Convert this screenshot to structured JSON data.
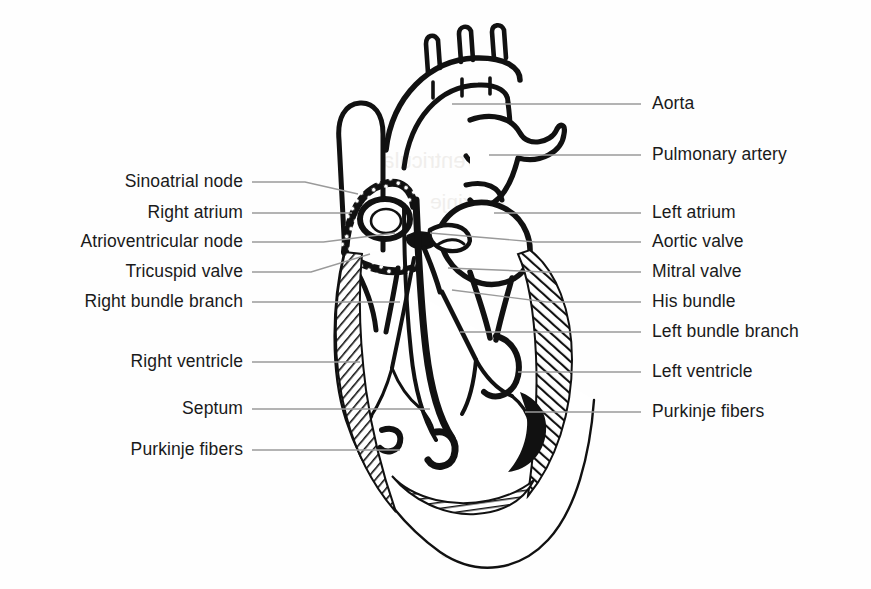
{
  "diagram": {
    "type": "labeled-anatomical-line-drawing",
    "background_color": "#fefefe",
    "ink_color": "#111111",
    "leader_line_color": "#9a9a9a",
    "canvas": {
      "width": 871,
      "height": 589
    }
  },
  "labels_left": [
    {
      "text": "Sinoatrial node",
      "text_right_x": 243,
      "text_y": 182,
      "leader_from_x": 252,
      "leader_from_y": 182,
      "leader_to_x": 358,
      "leader_to_y": 194
    },
    {
      "text": "Right atrium",
      "text_right_x": 243,
      "text_y": 213,
      "leader_from_x": 252,
      "leader_from_y": 213,
      "leader_to_x": 352,
      "leader_to_y": 213
    },
    {
      "text": "Atrioventricular node",
      "text_right_x": 243,
      "text_y": 242,
      "leader_from_x": 252,
      "leader_from_y": 242,
      "leader_to_x": 395,
      "leader_to_y": 233
    },
    {
      "text": "Tricuspid valve",
      "text_right_x": 243,
      "text_y": 272,
      "leader_from_x": 252,
      "leader_from_y": 272,
      "leader_to_x": 370,
      "leader_to_y": 254
    },
    {
      "text": "Right bundle branch",
      "text_right_x": 243,
      "text_y": 302,
      "leader_from_x": 252,
      "leader_from_y": 302,
      "leader_to_x": 400,
      "leader_to_y": 302
    },
    {
      "text": "Right ventricle",
      "text_right_x": 243,
      "text_y": 362,
      "leader_from_x": 252,
      "leader_from_y": 362,
      "leader_to_x": 360,
      "leader_to_y": 362
    },
    {
      "text": "Septum",
      "text_right_x": 243,
      "text_y": 409,
      "leader_from_x": 252,
      "leader_from_y": 409,
      "leader_to_x": 430,
      "leader_to_y": 409
    },
    {
      "text": "Purkinje fibers",
      "text_right_x": 243,
      "text_y": 450,
      "leader_from_x": 252,
      "leader_from_y": 450,
      "leader_to_x": 400,
      "leader_to_y": 450
    }
  ],
  "labels_right": [
    {
      "text": "Aorta",
      "text_left_x": 652,
      "text_y": 104,
      "leader_from_x": 641,
      "leader_from_y": 104,
      "leader_to_x": 452,
      "leader_to_y": 104
    },
    {
      "text": "Pulmonary artery",
      "text_left_x": 652,
      "text_y": 155,
      "leader_from_x": 641,
      "leader_from_y": 155,
      "leader_to_x": 489,
      "leader_to_y": 155
    },
    {
      "text": "Left atrium",
      "text_left_x": 652,
      "text_y": 213,
      "leader_from_x": 641,
      "leader_from_y": 213,
      "leader_to_x": 494,
      "leader_to_y": 213
    },
    {
      "text": "Aortic valve",
      "text_left_x": 652,
      "text_y": 242,
      "leader_from_x": 641,
      "leader_from_y": 242,
      "leader_to_x": 430,
      "leader_to_y": 233
    },
    {
      "text": "Mitral valve",
      "text_left_x": 652,
      "text_y": 272,
      "leader_from_x": 641,
      "leader_from_y": 272,
      "leader_to_x": 448,
      "leader_to_y": 268
    },
    {
      "text": "His bundle",
      "text_left_x": 652,
      "text_y": 302,
      "leader_from_x": 641,
      "leader_from_y": 302,
      "leader_to_x": 452,
      "leader_to_y": 290
    },
    {
      "text": "Left bundle branch",
      "text_left_x": 652,
      "text_y": 332,
      "leader_from_x": 641,
      "leader_from_y": 332,
      "leader_to_x": 460,
      "leader_to_y": 332
    },
    {
      "text": "Left ventricle",
      "text_left_x": 652,
      "text_y": 372,
      "leader_from_x": 641,
      "leader_from_y": 372,
      "leader_to_x": 518,
      "leader_to_y": 372
    },
    {
      "text": "Purkinje fibers",
      "text_left_x": 652,
      "text_y": 412,
      "leader_from_x": 641,
      "leader_from_y": 412,
      "leader_to_x": 525,
      "leader_to_y": 412
    }
  ],
  "ghost_text": [
    {
      "text": "Ventricular",
      "x": 375,
      "y": 148,
      "size": 22
    },
    {
      "text": "Purkinje",
      "x": 430,
      "y": 190,
      "size": 21
    },
    {
      "text": "right bundle",
      "x": 404,
      "y": 500,
      "size": 21
    },
    {
      "text": "Purkinje",
      "x": 440,
      "y": 540,
      "size": 20
    }
  ]
}
